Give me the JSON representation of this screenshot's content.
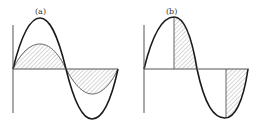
{
  "figure": {
    "panels": [
      {
        "id": "a",
        "label": "(a)",
        "description": "Large sine wave with a smaller-amplitude sine wave; the area between the small sine and the axis is hatched over a full period"
      },
      {
        "id": "b",
        "label": "(b)",
        "description": "Sine wave with hatched regions from the peak to the zero crossing and from the trough to the end of the period"
      }
    ]
  },
  "colors": {
    "stroke": "#1a1a1a",
    "thin_stroke": "#555555",
    "hatch": "#8a8a8a",
    "background": "#ffffff"
  }
}
